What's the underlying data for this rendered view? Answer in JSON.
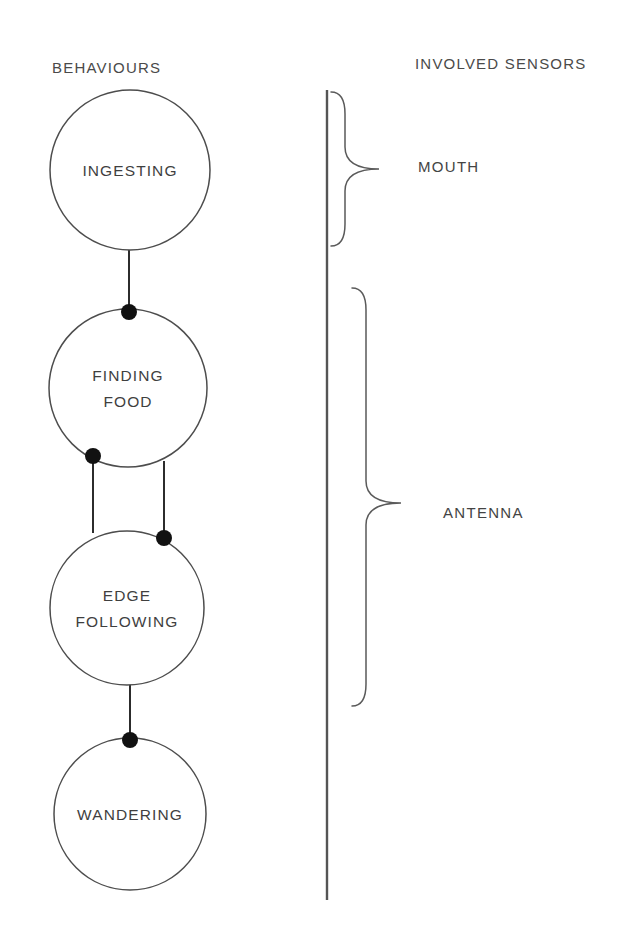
{
  "columns": {
    "behaviours_header": "BEHAVIOURS",
    "sensors_header": "INVOLVED SENSORS"
  },
  "behaviours": [
    {
      "id": "ingesting",
      "label_lines": [
        "INGESTING"
      ],
      "cx": 130,
      "cy": 170,
      "r": 80
    },
    {
      "id": "finding-food",
      "label_lines": [
        "FINDING",
        "FOOD"
      ],
      "cx": 128,
      "cy": 388,
      "r": 79
    },
    {
      "id": "edge-following",
      "label_lines": [
        "EDGE",
        "FOLLOWING"
      ],
      "cx": 127,
      "cy": 608,
      "r": 77
    },
    {
      "id": "wandering",
      "label_lines": [
        "WANDERING"
      ],
      "cx": 130,
      "cy": 814,
      "r": 76
    }
  ],
  "connections": [
    {
      "id": "ingesting-to-finding-food",
      "x1": 129,
      "y1": 250,
      "x2": 129,
      "y2": 311
    },
    {
      "id": "finding-food-to-edge-following-left",
      "x1": 93,
      "y1": 457,
      "x2": 93,
      "y2": 533
    },
    {
      "id": "finding-food-to-edge-following-right",
      "x1": 164,
      "y1": 461,
      "x2": 164,
      "y2": 537
    },
    {
      "id": "edge-following-to-wandering",
      "x1": 130,
      "y1": 684,
      "x2": 130,
      "y2": 740
    }
  ],
  "junction_dots": [
    {
      "id": "dot-finding-food-top",
      "cx": 129,
      "cy": 312,
      "r": 8
    },
    {
      "id": "dot-finding-food-lower-left",
      "cx": 93,
      "cy": 456,
      "r": 8
    },
    {
      "id": "dot-edge-following-upper-right",
      "cx": 164,
      "cy": 538,
      "r": 8
    },
    {
      "id": "dot-wandering-top",
      "cx": 130,
      "cy": 740,
      "r": 8
    }
  ],
  "divider": {
    "x": 327,
    "y1": 90,
    "y2": 900
  },
  "sensors": [
    {
      "id": "mouth",
      "label": "MOUTH",
      "label_x": 418,
      "label_y": 172,
      "brace": {
        "x": 345,
        "top": 92,
        "bottom": 246,
        "tip_x": 379,
        "tip_y": 169
      }
    },
    {
      "id": "antenna",
      "label": "ANTENNA",
      "label_x": 443,
      "label_y": 518,
      "brace": {
        "x": 366,
        "top": 288,
        "bottom": 706,
        "tip_x": 401,
        "tip_y": 503
      }
    }
  ],
  "colors": {
    "background": "#ffffff",
    "stroke": "#4d4d4d",
    "dot": "#111111",
    "text": "#3f3f3f"
  }
}
